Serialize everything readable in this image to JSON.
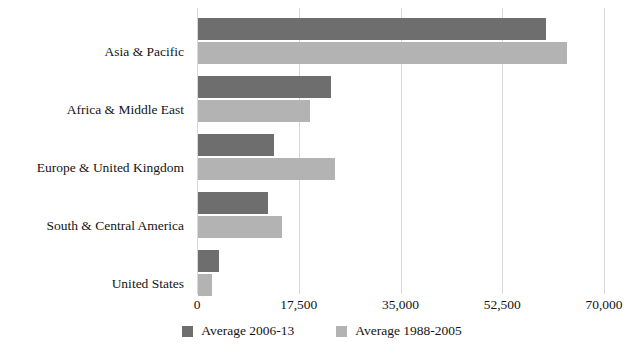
{
  "chart_data": {
    "type": "bar",
    "orientation": "horizontal",
    "title": "",
    "subtitle": "",
    "xlabel": "",
    "ylabel": "",
    "categories": [
      "Asia & Pacific",
      "Africa & Middle East",
      "Europe & United Kingdom",
      "South & Central America",
      "United States"
    ],
    "series": [
      {
        "name": "Average 2006-13",
        "color": "#6e6e6e",
        "values": [
          59800,
          22900,
          13000,
          12050,
          3600
        ]
      },
      {
        "name": "Average 1988-2005",
        "color": "#b3b3b3",
        "values": [
          63400,
          19300,
          23600,
          14400,
          2350
        ]
      }
    ],
    "xlim": [
      0,
      70000
    ],
    "xticks": [
      0,
      17500,
      35000,
      52500,
      70000
    ],
    "xtick_labels": [
      "0",
      "17,500",
      "35,000",
      "52,500",
      "70,000"
    ],
    "grid": true,
    "grid_axis": "x",
    "legend": {
      "position": "bottom",
      "entries": [
        {
          "label": "Average 2006-13",
          "color": "#6e6e6e"
        },
        {
          "label": "Average 1988-2005",
          "color": "#b3b3b3"
        }
      ]
    }
  }
}
